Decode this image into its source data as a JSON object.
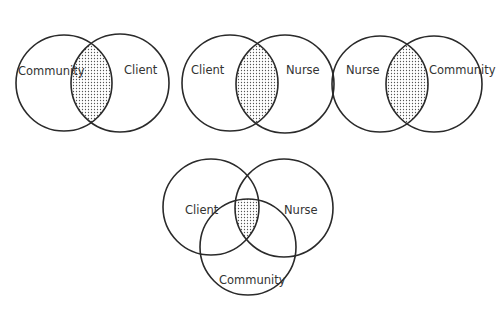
{
  "diagrams": [
    {
      "id": "community-client",
      "circles": [
        {
          "label": "Community",
          "cx": 64,
          "cy": 83,
          "r": 48,
          "lx": 18,
          "ly": 71
        },
        {
          "label": "Client",
          "cx": 120,
          "cy": 83,
          "r": 49,
          "lx": 124,
          "ly": 70
        }
      ]
    },
    {
      "id": "client-nurse",
      "circles": [
        {
          "label": "Client",
          "cx": 230,
          "cy": 83,
          "r": 48,
          "lx": 191,
          "ly": 69
        },
        {
          "label": "Nurse",
          "cx": 285,
          "cy": 84,
          "r": 49,
          "lx": 286,
          "ly": 69
        }
      ]
    },
    {
      "id": "nurse-community",
      "circles": [
        {
          "label": "Nurse",
          "cx": 380,
          "cy": 84,
          "r": 48,
          "lx": 346,
          "ly": 69
        },
        {
          "label": "Community",
          "cx": 434,
          "cy": 84,
          "r": 48,
          "lx": 429,
          "ly": 69
        }
      ]
    }
  ],
  "three_way": {
    "id": "client-nurse-community",
    "circles": [
      {
        "label": "Client",
        "cx": 211,
        "cy": 207,
        "r": 48,
        "lx": 185,
        "ly": 210
      },
      {
        "label": "Nurse",
        "cx": 284,
        "cy": 208,
        "r": 49,
        "lx": 284,
        "ly": 210
      },
      {
        "label": "Community",
        "cx": 248,
        "cy": 247,
        "r": 48,
        "lx": 219,
        "ly": 280
      }
    ]
  },
  "colors": {
    "stroke": "#2a2a2a",
    "shade_dot": "#555555",
    "text": "#333333",
    "background": "#ffffff"
  }
}
